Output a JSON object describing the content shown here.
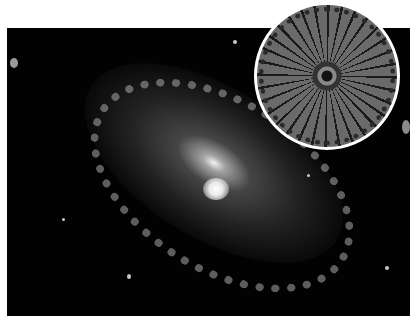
{
  "image": {
    "description": "Grayscale photograph of a spiral galaxy with a circular inset showing a radially symmetric diatom",
    "main_subject": "spiral-galaxy",
    "inset_subject": "diatom-radial-structure",
    "colors": {
      "background": "#ffffff",
      "sky": "#020202",
      "core": "#ffffff",
      "inset_border": "#ffffff"
    }
  }
}
